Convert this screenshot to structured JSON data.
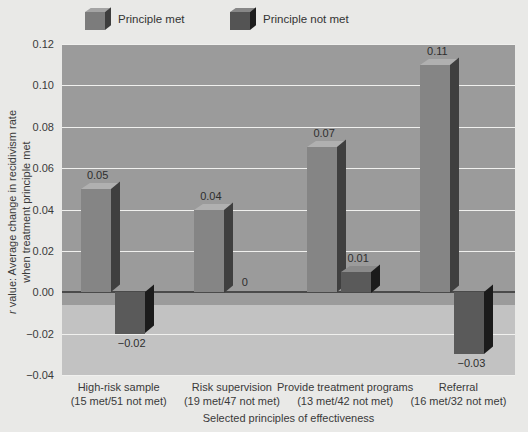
{
  "chart_data": {
    "type": "bar",
    "title": "",
    "xlabel": "Selected principles of effectiveness",
    "ylabel": "r value: Average change in recidivism rate when treatment principle met",
    "ylabel_line1": "r value: Average change in recidivism rate",
    "ylabel_line2": "when treatment principle met",
    "ylim": [
      -0.04,
      0.12
    ],
    "ytick_labels": [
      "0.12",
      "0.10",
      "0.08",
      "0.06",
      "0.04",
      "0.02",
      "0.00",
      "−0.02",
      "−0.04"
    ],
    "ytick_values": [
      0.12,
      0.1,
      0.08,
      0.06,
      0.04,
      0.02,
      0.0,
      -0.02,
      -0.04
    ],
    "grid": true,
    "legend_position": "top",
    "categories": [
      "High-risk sample",
      "Risk supervision",
      "Provide treatment programs",
      "Referral"
    ],
    "category_sublabels": [
      "(15 met/51 not met)",
      "(19 met/47 not met)",
      "(13 met/42 not met)",
      "(16 met/32 not met)"
    ],
    "series": [
      {
        "name": "Principle met",
        "color": "#858585",
        "values": [
          0.05,
          0.04,
          0.07,
          0.11
        ],
        "labels": [
          "0.05",
          "0.04",
          "0.07",
          "0.11"
        ]
      },
      {
        "name": "Principle not met",
        "color": "#5a5a5a",
        "values": [
          -0.02,
          0,
          0.01,
          -0.03
        ],
        "labels": [
          "−0.02",
          "0",
          "0.01",
          "−0.03"
        ]
      }
    ]
  },
  "legend": {
    "items": [
      {
        "label": "Principle met",
        "swatch": "legend-swatch-principle-met"
      },
      {
        "label": "Principle not met",
        "swatch": "legend-swatch-principle-not-met"
      }
    ]
  }
}
